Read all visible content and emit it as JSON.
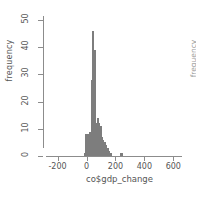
{
  "chart_data": {
    "type": "bar",
    "subtype": "histogram",
    "title": "",
    "xlabel": "co$gdp_change",
    "ylabel": "frequency",
    "xlim": [
      -280,
      660
    ],
    "ylim": [
      0,
      50
    ],
    "xticks": [
      -200,
      0,
      200,
      400,
      600
    ],
    "ytick_labels": [
      "0",
      "10",
      "20",
      "30",
      "40",
      "50"
    ],
    "yticks": [
      0,
      10,
      20,
      30,
      40,
      50
    ],
    "grid": false,
    "legend": false,
    "bar_color": "#9a9a9a",
    "bin_width": 10,
    "bin_starts": [
      -20,
      -10,
      0,
      10,
      20,
      30,
      40,
      50,
      60,
      70,
      80,
      90,
      100,
      110,
      120,
      130,
      140,
      150,
      160,
      230,
      240
    ],
    "values": [
      1,
      8,
      8,
      8,
      9,
      28,
      46,
      39,
      12,
      14,
      12,
      11,
      7,
      6,
      5,
      4,
      3,
      2,
      1,
      1,
      1
    ]
  },
  "axes": {
    "y_label": "frequency",
    "x_label": "co$gdp_change",
    "x_tick_labels": [
      "-200",
      "0",
      "200",
      "400",
      "600"
    ],
    "y_tick_labels": [
      "0",
      "10",
      "20",
      "30",
      "40",
      "50"
    ]
  },
  "neighbor_plot": {
    "partial_label": "frequency"
  }
}
